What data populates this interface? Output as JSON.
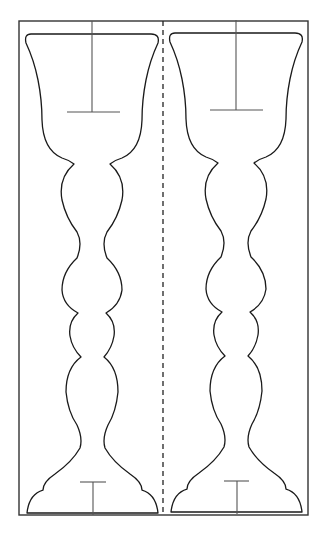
{
  "figure": {
    "title": "",
    "colors": {
      "background": "#ffffff",
      "outline": "#1a1a1a",
      "guide": "#555555"
    },
    "frame": {
      "x": 19,
      "y": 21,
      "width": 289,
      "height": 494
    },
    "fold_line": {
      "x": 163,
      "style": "dashed"
    },
    "goblets": [
      {
        "id": "left",
        "offset_x": 0,
        "top_guide": {
          "x": 92,
          "bar_y": 112,
          "bar_from": 67,
          "bar_to": 120
        },
        "bottom_guide": {
          "x": 93,
          "bar_y": 482,
          "bar_from": 80,
          "bar_to": 106
        }
      },
      {
        "id": "right",
        "offset_x": 144,
        "top_guide": {
          "x": 236,
          "bar_y": 110,
          "bar_from": 210,
          "bar_to": 263
        },
        "bottom_guide": {
          "x": 237,
          "bar_y": 481,
          "bar_from": 224,
          "bar_to": 249
        }
      }
    ]
  }
}
